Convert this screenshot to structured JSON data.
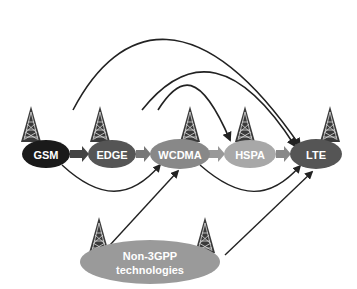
{
  "diagram": {
    "nodes": [
      {
        "id": "gsm",
        "label": "GSM",
        "color": "#1a1a1a",
        "cx": 46,
        "cy": 154,
        "rx": 24,
        "ry": 14
      },
      {
        "id": "edge",
        "label": "EDGE",
        "color": "#555555",
        "cx": 112,
        "cy": 154,
        "rx": 24,
        "ry": 14
      },
      {
        "id": "wcdma",
        "label": "WCDMA",
        "color": "#888888",
        "cx": 180,
        "cy": 154,
        "rx": 30,
        "ry": 15
      },
      {
        "id": "hspa",
        "label": "HSPA",
        "color": "#a8a8a8",
        "cx": 250,
        "cy": 154,
        "rx": 26,
        "ry": 14
      },
      {
        "id": "lte",
        "label": "LTE",
        "color": "#555555",
        "cx": 316,
        "cy": 154,
        "rx": 26,
        "ry": 15
      }
    ],
    "non3gpp": {
      "id": "non3gpp",
      "line1": "Non-3GPP",
      "line2": "technologies",
      "color": "#9a9a9a",
      "cx": 140,
      "cy": 262,
      "rx": 70,
      "ry": 22
    },
    "edges": [
      {
        "from": "GSM",
        "to": "EDGE",
        "type": "block-arrow"
      },
      {
        "from": "EDGE",
        "to": "WCDMA",
        "type": "block-arrow"
      },
      {
        "from": "WCDMA",
        "to": "HSPA",
        "type": "block-arrow"
      },
      {
        "from": "HSPA",
        "to": "LTE",
        "type": "block-arrow"
      },
      {
        "from": "GSM",
        "to": "LTE",
        "type": "curve-top"
      },
      {
        "from": "GSM",
        "to": "WCDMA",
        "type": "curve-bottom"
      },
      {
        "from": "EDGE",
        "to": "LTE",
        "type": "curve-top"
      },
      {
        "from": "EDGE",
        "to": "HSPA",
        "type": "curve-top"
      },
      {
        "from": "WCDMA",
        "to": "LTE",
        "type": "curve-bottom"
      },
      {
        "from": "Non-3GPP technologies",
        "to": "WCDMA",
        "type": "line"
      },
      {
        "from": "Non-3GPP technologies",
        "to": "LTE",
        "type": "line"
      }
    ],
    "icons": [
      "radio-tower-icon"
    ]
  }
}
